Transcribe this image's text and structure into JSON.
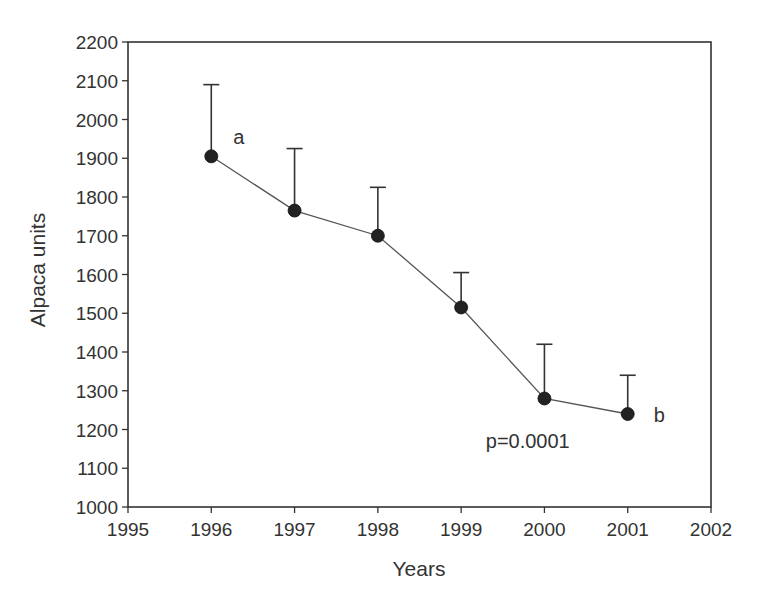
{
  "chart_data": {
    "type": "line",
    "title": "",
    "xlabel": "Years",
    "ylabel": "Alpaca units",
    "xlim": [
      1995,
      2002
    ],
    "ylim": [
      1000,
      2200
    ],
    "x_ticks": [
      1995,
      1996,
      1997,
      1998,
      1999,
      2000,
      2001,
      2002
    ],
    "y_ticks": [
      1000,
      1100,
      1200,
      1300,
      1400,
      1500,
      1600,
      1700,
      1800,
      1900,
      2000,
      2100,
      2200
    ],
    "grid": false,
    "legend": null,
    "series": [
      {
        "name": "Alpaca units",
        "x": [
          1996,
          1997,
          1998,
          1999,
          2000,
          2001
        ],
        "values": [
          1905,
          1765,
          1700,
          1515,
          1280,
          1240
        ],
        "error_upper": [
          2090,
          1925,
          1825,
          1605,
          1420,
          1340
        ],
        "marker": "filled-circle",
        "color": "#222222"
      }
    ],
    "annotations": [
      {
        "text": "a",
        "x": 1996,
        "y": 1905,
        "position": "upper-right"
      },
      {
        "text": "b",
        "x": 2001,
        "y": 1240,
        "position": "right"
      },
      {
        "text": "p=0.0001",
        "x": 1999.8,
        "y": 1170,
        "position": "center"
      }
    ]
  },
  "colors": {
    "axis": "#333333",
    "line": "#555555",
    "marker": "#222222",
    "text": "#333333",
    "background": "#ffffff"
  }
}
